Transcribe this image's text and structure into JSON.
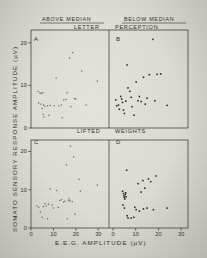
{
  "figure": {
    "background_color": "#ddddd5",
    "ink_color": "#2e2d2b"
  },
  "column_headers": [
    {
      "label": "ABOVE  MEDIAN"
    },
    {
      "label": "BELOW  MEDIAN"
    }
  ],
  "row_titles": [
    {
      "left_word": "LETTER",
      "right_word": "PERCEPTION"
    },
    {
      "left_word": "LIFTED",
      "right_word": "WEIGHTS"
    }
  ],
  "axes": {
    "x_title": "E.E.G.   AMPLITUDE   (µV)",
    "y_title": "SOMATO  SENSORY  RESPONSE  AMPLITUDE  (µV)",
    "x_ticks": [
      "0",
      "10",
      "20",
      "30"
    ],
    "y_ticks": [
      "0",
      "10",
      "20"
    ],
    "xlim": [
      0,
      33
    ],
    "ylim": [
      0,
      23
    ]
  },
  "chart_data": {
    "type": "scatter",
    "xlabel": "E.E.G. AMPLITUDE (µV)",
    "ylabel": "SOMATO SENSORY RESPONSE AMPLITUDE (µV)",
    "xlim": [
      0,
      33
    ],
    "ylim": [
      0,
      23
    ],
    "grid": false,
    "legend": "none",
    "panels": [
      {
        "id": "A",
        "panel_letter": "A",
        "column": "ABOVE MEDIAN",
        "task": "LETTER PERCEPTION",
        "marker_shade": "light",
        "points": [
          [
            3.2,
            8.6
          ],
          [
            4.0,
            8.2
          ],
          [
            4.6,
            8.1
          ],
          [
            5.2,
            8.3
          ],
          [
            3.4,
            5.9
          ],
          [
            4.4,
            5.6
          ],
          [
            5.6,
            5.4
          ],
          [
            5.0,
            4.6
          ],
          [
            5.4,
            3.2
          ],
          [
            5.8,
            2.6
          ],
          [
            6.2,
            5.1
          ],
          [
            7.4,
            5.2
          ],
          [
            8.0,
            3.0
          ],
          [
            8.6,
            5.3
          ],
          [
            10.4,
            5.2
          ],
          [
            11.2,
            11.7
          ],
          [
            12.4,
            5.2
          ],
          [
            13.6,
            5.4
          ],
          [
            14.0,
            2.4
          ],
          [
            14.6,
            6.6
          ],
          [
            15.6,
            6.7
          ],
          [
            16.0,
            8.3
          ],
          [
            17.2,
            16.4
          ],
          [
            17.8,
            5.0
          ],
          [
            18.6,
            17.7
          ],
          [
            19.4,
            6.9
          ],
          [
            20.0,
            6.8
          ],
          [
            22.6,
            13.4
          ],
          [
            24.6,
            5.4
          ],
          [
            29.6,
            11.0
          ]
        ]
      },
      {
        "id": "B",
        "panel_letter": "B",
        "column": "BELOW MEDIAN",
        "task": "LETTER PERCEPTION",
        "marker_shade": "dark",
        "points": [
          [
            1.2,
            6.6
          ],
          [
            1.6,
            5.2
          ],
          [
            2.4,
            5.4
          ],
          [
            2.8,
            4.4
          ],
          [
            3.4,
            7.4
          ],
          [
            3.8,
            6.8
          ],
          [
            4.2,
            6.0
          ],
          [
            4.6,
            4.2
          ],
          [
            5.0,
            3.4
          ],
          [
            5.6,
            6.3
          ],
          [
            6.2,
            14.8
          ],
          [
            6.6,
            9.4
          ],
          [
            7.4,
            8.6
          ],
          [
            8.0,
            7.2
          ],
          [
            8.4,
            5.0
          ],
          [
            9.2,
            3.0
          ],
          [
            10.2,
            10.8
          ],
          [
            11.0,
            6.4
          ],
          [
            11.6,
            7.4
          ],
          [
            12.4,
            6.2
          ],
          [
            13.4,
            11.9
          ],
          [
            14.2,
            5.6
          ],
          [
            15.0,
            7.0
          ],
          [
            16.0,
            12.5
          ],
          [
            17.6,
            20.8
          ],
          [
            18.4,
            6.4
          ],
          [
            19.4,
            12.6
          ],
          [
            21.0,
            12.7
          ],
          [
            23.8,
            5.3
          ]
        ]
      },
      {
        "id": "C",
        "panel_letter": "C",
        "column": "ABOVE MEDIAN",
        "task": "LIFTED WEIGHTS",
        "marker_shade": "light",
        "points": [
          [
            2.6,
            5.8
          ],
          [
            3.4,
            5.4
          ],
          [
            4.2,
            4.2
          ],
          [
            5.0,
            2.8
          ],
          [
            5.6,
            5.6
          ],
          [
            6.2,
            6.4
          ],
          [
            6.8,
            5.8
          ],
          [
            7.4,
            2.4
          ],
          [
            7.8,
            6.2
          ],
          [
            8.6,
            10.2
          ],
          [
            9.4,
            6.0
          ],
          [
            10.0,
            5.2
          ],
          [
            11.4,
            9.8
          ],
          [
            12.2,
            5.4
          ],
          [
            12.8,
            7.2
          ],
          [
            13.6,
            7.4
          ],
          [
            14.6,
            6.8
          ],
          [
            15.2,
            7.0
          ],
          [
            15.8,
            16.5
          ],
          [
            16.2,
            2.4
          ],
          [
            16.8,
            7.2
          ],
          [
            17.0,
            7.6
          ],
          [
            17.4,
            7.1
          ],
          [
            17.6,
            21.4
          ],
          [
            18.4,
            6.9
          ],
          [
            19.0,
            18.6
          ],
          [
            19.6,
            3.6
          ],
          [
            21.4,
            12.7
          ],
          [
            22.0,
            9.6
          ],
          [
            29.6,
            11.2
          ]
        ]
      },
      {
        "id": "D",
        "panel_letter": "D",
        "column": "BELOW MEDIAN",
        "task": "LIFTED WEIGHTS",
        "marker_shade": "dark",
        "points": [
          [
            4.2,
            9.6
          ],
          [
            4.6,
            9.0
          ],
          [
            4.8,
            8.4
          ],
          [
            5.0,
            8.0
          ],
          [
            5.2,
            7.6
          ],
          [
            5.4,
            8.8
          ],
          [
            5.6,
            9.2
          ],
          [
            5.8,
            8.2
          ],
          [
            4.4,
            6.0
          ],
          [
            5.0,
            5.2
          ],
          [
            6.0,
            15.1
          ],
          [
            6.2,
            3.2
          ],
          [
            6.6,
            2.6
          ],
          [
            8.0,
            2.6
          ],
          [
            9.2,
            2.8
          ],
          [
            9.6,
            5.4
          ],
          [
            10.2,
            4.8
          ],
          [
            11.0,
            11.6
          ],
          [
            11.6,
            4.4
          ],
          [
            12.4,
            9.4
          ],
          [
            13.2,
            12.4
          ],
          [
            13.4,
            5.0
          ],
          [
            14.0,
            10.4
          ],
          [
            15.0,
            5.2
          ],
          [
            15.6,
            12.8
          ],
          [
            16.6,
            12.1
          ],
          [
            17.8,
            4.8
          ],
          [
            19.0,
            13.6
          ],
          [
            23.8,
            5.2
          ]
        ]
      }
    ]
  }
}
